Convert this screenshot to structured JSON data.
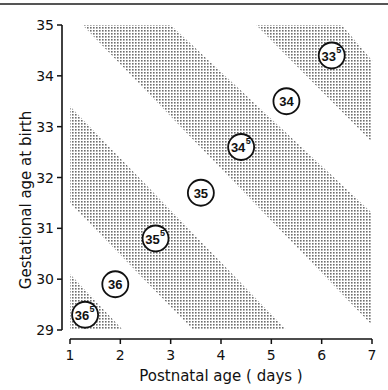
{
  "chart_data": {
    "type": "scatter",
    "title": "",
    "xlabel": "Postnatal age (days)",
    "ylabel": "Gestational age at birth",
    "xlim": [
      1,
      7
    ],
    "ylim": [
      29,
      35
    ],
    "x_ticks": [
      "1",
      "2",
      "3",
      "4",
      "5",
      "6",
      "7"
    ],
    "y_ticks": [
      "29",
      "30",
      "31",
      "32",
      "33",
      "34",
      "35"
    ],
    "grid": false,
    "legend": null,
    "annotations": [
      {
        "label": "33",
        "sup": "5",
        "x": 6.2,
        "y": 34.4
      },
      {
        "label": "34",
        "sup": "",
        "x": 5.3,
        "y": 33.5
      },
      {
        "label": "34",
        "sup": "5",
        "x": 4.4,
        "y": 32.6
      },
      {
        "label": "35",
        "sup": "",
        "x": 3.6,
        "y": 31.7
      },
      {
        "label": "35",
        "sup": "5",
        "x": 2.7,
        "y": 30.8
      },
      {
        "label": "36",
        "sup": "",
        "x": 1.9,
        "y": 29.9
      },
      {
        "label": "36",
        "sup": "5",
        "x": 1.3,
        "y": 29.3
      }
    ],
    "shaded_bands": [
      {
        "description": "bottom-left triangle",
        "approx_vertices": [
          [
            1,
            30.1
          ],
          [
            1,
            29
          ],
          [
            2.05,
            29
          ]
        ]
      },
      {
        "description": "band containing 35.5",
        "approx_vertices": [
          [
            1,
            33.4
          ],
          [
            1,
            31.5
          ],
          [
            3.45,
            29
          ],
          [
            5.3,
            29
          ]
        ]
      },
      {
        "description": "band containing 34.5",
        "approx_vertices": [
          [
            1.25,
            35
          ],
          [
            3.0,
            35
          ],
          [
            7,
            31.3
          ],
          [
            7,
            29.1
          ]
        ]
      },
      {
        "description": "top-right band containing 33.5",
        "approx_vertices": [
          [
            4.7,
            35
          ],
          [
            6.4,
            35
          ],
          [
            7,
            34.3
          ],
          [
            7,
            32.7
          ]
        ]
      }
    ]
  },
  "axes": {
    "x_title": "Postnatal age ( days )",
    "y_title": "Gestational age at birth"
  }
}
